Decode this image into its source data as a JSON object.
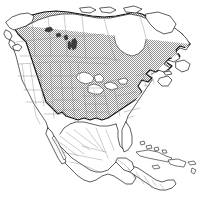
{
  "figure": {
    "kind": "range-map",
    "caption": "",
    "background_color": "#ffffff",
    "width": 202,
    "height": 202
  },
  "legend": {
    "visible": false,
    "entries": [
      {
        "label": "Range (present)",
        "swatch": "hatched-gray",
        "color": "#9a9a9a"
      },
      {
        "label": "Absent",
        "swatch": "white",
        "color": "#ffffff"
      }
    ]
  },
  "styling": {
    "coastline_color": "#1a1a1a",
    "subdivision_color": "#8d8d8d",
    "range_outline_color": "#111111",
    "range_fill_color": "#9a9a9a",
    "water_color": "#ffffff",
    "lake_color": "#3d3d3d"
  },
  "regions": {
    "shaded": [
      "Alaska (southeast panhandle)",
      "Yukon",
      "British Columbia",
      "Alberta",
      "Saskatchewan",
      "Manitoba",
      "Ontario",
      "Quebec",
      "Newfoundland and Labrador",
      "New Brunswick",
      "Nova Scotia",
      "Prince Edward Island",
      "Northwest Territories (southern)",
      "Montana (eastern)",
      "North Dakota",
      "South Dakota",
      "Nebraska",
      "Kansas",
      "Oklahoma (eastern)",
      "Texas (eastern)",
      "Minnesota",
      "Iowa",
      "Missouri",
      "Arkansas",
      "Louisiana",
      "Wisconsin",
      "Illinois",
      "Michigan",
      "Indiana",
      "Ohio",
      "Kentucky",
      "Tennessee",
      "Mississippi",
      "Alabama",
      "Georgia",
      "Florida (northern)",
      "South Carolina",
      "North Carolina",
      "Virginia",
      "West Virginia",
      "Pennsylvania",
      "New York",
      "New Jersey",
      "Maryland",
      "Delaware",
      "Connecticut",
      "Rhode Island",
      "Massachusetts",
      "Vermont",
      "New Hampshire",
      "Maine"
    ],
    "unshaded": [
      "Alaska (mainland)",
      "Washington",
      "Oregon",
      "California",
      "Idaho",
      "Nevada",
      "Utah",
      "Arizona",
      "New Mexico",
      "Colorado",
      "Wyoming",
      "Montana (western)",
      "Mexico",
      "Guatemala",
      "Belize",
      "Honduras",
      "El Salvador",
      "Nicaragua",
      "Costa Rica",
      "Panama",
      "Cuba",
      "Jamaica",
      "Hispaniola",
      "Puerto Rico",
      "Bahamas",
      "Greenland (not shown)"
    ]
  },
  "water_bodies": [
    "Hudson Bay",
    "Great Lakes",
    "Gulf of Mexico",
    "Caribbean Sea",
    "Atlantic Ocean",
    "Pacific Ocean",
    "Gulf of California",
    "Great Salt Lake",
    "Lake Winnipeg"
  ],
  "labels": []
}
